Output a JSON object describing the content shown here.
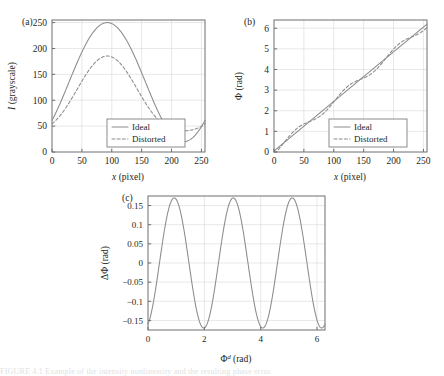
{
  "figure": {
    "caption_fragment": "FIGURE 4.1   Example of the intensity nonlinearity and the resulting phase error."
  },
  "panels": {
    "a": {
      "tag": "(a)",
      "legend": [
        "Ideal",
        "Distorted"
      ],
      "legend_styles": [
        "solid",
        "dashed"
      ]
    },
    "b": {
      "tag": "(b)",
      "legend": [
        "Ideal",
        "Distorted"
      ],
      "legend_styles": [
        "solid",
        "dashed"
      ]
    },
    "c": {
      "tag": "(c)"
    }
  },
  "chart_data": [
    {
      "id": "panel-a",
      "type": "line",
      "title": "",
      "xlabel": "x (pixel)",
      "ylabel": "I (grayscale)",
      "xlabel_italic_prefix": "x",
      "ylabel_italic_prefix": "I",
      "xlim": [
        0,
        256
      ],
      "ylim": [
        0,
        255
      ],
      "xticks": [
        0,
        50,
        100,
        150,
        200,
        250
      ],
      "yticks": [
        0,
        50,
        100,
        150,
        200,
        250
      ],
      "grid": true,
      "legend_position": "lower-center",
      "series": [
        {
          "name": "Ideal",
          "style": "solid",
          "model": "cosine",
          "offset": 135,
          "amplitude": 115,
          "period": 256,
          "phase_deg": -130
        },
        {
          "name": "Distorted",
          "style": "dashed",
          "model": "gamma-cosine",
          "offset": 135,
          "amplitude": 115,
          "period": 256,
          "phase_deg": -130,
          "gamma": 1.55,
          "out_min": 38,
          "out_max": 190
        }
      ]
    },
    {
      "id": "panel-b",
      "type": "line",
      "title": "",
      "xlabel": "x (pixel)",
      "ylabel": "Φ (rad)",
      "xlabel_italic_prefix": "x",
      "xlim": [
        0,
        256
      ],
      "ylim": [
        0,
        6.4
      ],
      "xticks": [
        0,
        50,
        100,
        150,
        200,
        250
      ],
      "yticks": [
        0,
        1,
        2,
        3,
        4,
        5,
        6
      ],
      "grid": true,
      "legend_position": "lower-center",
      "series": [
        {
          "name": "Ideal",
          "style": "solid",
          "model": "linear",
          "y_start": 0.05,
          "y_end": 6.2
        },
        {
          "name": "Distorted",
          "style": "dashed",
          "model": "linear-plus-ripple",
          "y_start": 0.05,
          "y_end": 6.2,
          "ripple_amplitude": 0.17,
          "ripple_cycles": 3,
          "ripple_phase_deg": 200
        }
      ]
    },
    {
      "id": "panel-c",
      "type": "line",
      "title": "",
      "xlabel": "Φᵈ (rad)",
      "ylabel": "ΔΦ (rad)",
      "xlabel_base": "Φ",
      "xlabel_sup": "d",
      "xlabel_unit": "(rad)",
      "xlim": [
        0,
        6.283
      ],
      "ylim": [
        -0.175,
        0.175
      ],
      "xticks": [
        0,
        2,
        4,
        6
      ],
      "yticks": [
        0.15,
        0.1,
        0.05,
        0,
        -0.05,
        -0.1,
        -0.15
      ],
      "ytick_labels": [
        "0.15",
        "0.1",
        "0.05",
        "0",
        "−0.05",
        "−0.1",
        "−0.15"
      ],
      "grid": true,
      "series": [
        {
          "name": "Phase error",
          "style": "solid",
          "model": "cosine",
          "offset": 0,
          "amplitude": 0.17,
          "cycles": 3,
          "phase_deg": 200
        }
      ]
    }
  ]
}
